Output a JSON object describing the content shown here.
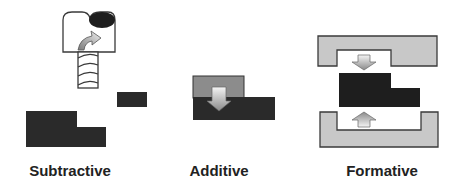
{
  "panels": [
    {
      "id": "subtractive",
      "label": "Subtractive",
      "center_x": 70
    },
    {
      "id": "additive",
      "label": "Additive",
      "center_x": 219
    },
    {
      "id": "formative",
      "label": "Formative",
      "center_x": 382
    }
  ],
  "colors": {
    "part": "#2a2a2a",
    "added_material": "#8c8c8c",
    "die": "#c8c8c8",
    "outline": "#3a3a3a",
    "arrow_light": "#f2f2f2",
    "arrow_dark": "#8a8a8a",
    "label": "#222222"
  }
}
